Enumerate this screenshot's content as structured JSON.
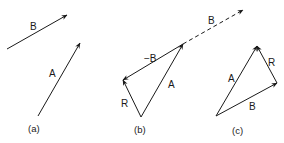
{
  "diagram": {
    "panels": [
      {
        "caption": "(a)",
        "vectors": [
          {
            "label": "B",
            "from": [
              7,
              49
            ],
            "to": [
              67,
              15
            ],
            "style": "solid"
          },
          {
            "label": "A",
            "from": [
              38,
              116
            ],
            "to": [
              80,
              43
            ],
            "style": "solid"
          }
        ]
      },
      {
        "caption": "(b)",
        "vectors": [
          {
            "label": "A",
            "from": [
              141,
              117
            ],
            "to": [
              183,
              44
            ],
            "style": "solid"
          },
          {
            "label": "−B",
            "from": [
              183,
              44
            ],
            "to": [
              123,
              80
            ],
            "style": "solid"
          },
          {
            "label": "R",
            "from": [
              141,
              117
            ],
            "to": [
              123,
              80
            ],
            "style": "solid"
          },
          {
            "label": "B",
            "from": [
              183,
              44
            ],
            "to": [
              243,
              10
            ],
            "style": "dashed"
          }
        ]
      },
      {
        "caption": "(c)",
        "vectors": [
          {
            "label": "A",
            "from": [
              216,
              116
            ],
            "to": [
              257,
              46
            ],
            "style": "solid"
          },
          {
            "label": "B",
            "from": [
              216,
              116
            ],
            "to": [
              277,
              83
            ],
            "style": "solid"
          },
          {
            "label": "R",
            "from": [
              277,
              83
            ],
            "to": [
              257,
              46
            ],
            "style": "solid"
          }
        ]
      }
    ]
  },
  "labels": {
    "a_B": "B",
    "a_A": "A",
    "a_caption": "(a)",
    "b_minusB": "−B",
    "b_A": "A",
    "b_R": "R",
    "b_dashB": "B",
    "b_caption": "(b)",
    "c_A": "A",
    "c_R": "R",
    "c_B": "B",
    "c_caption": "(c)"
  },
  "colors": {
    "ink": "#1a1a1a",
    "background": "#ffffff"
  }
}
